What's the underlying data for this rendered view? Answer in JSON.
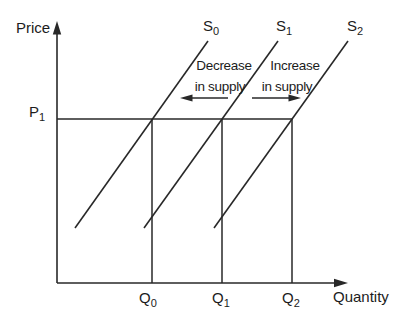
{
  "figure": {
    "background_color": "#ffffff",
    "line_color": "#282828",
    "text_color": "#1c1c1c"
  },
  "axes": {
    "y_axis_label": "Price",
    "x_axis_label": "Quantity"
  },
  "price_tick": {
    "base": "P",
    "sub": "1"
  },
  "quantity_ticks": [
    {
      "base": "Q",
      "sub": "0"
    },
    {
      "base": "Q",
      "sub": "1"
    },
    {
      "base": "Q",
      "sub": "2"
    }
  ],
  "curves": [
    {
      "base": "S",
      "sub": "0"
    },
    {
      "base": "S",
      "sub": "1"
    },
    {
      "base": "S",
      "sub": "2"
    }
  ],
  "annotations": {
    "decrease_line1": "Decrease",
    "decrease_line2": "in supply",
    "increase_line1": "Increase",
    "increase_line2": "in supply"
  }
}
